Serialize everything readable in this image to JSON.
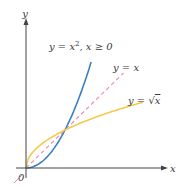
{
  "chart_data": {
    "type": "line",
    "title": "",
    "xlabel": "x",
    "ylabel": "y",
    "origin_label": "0",
    "xlim": [
      0,
      3.6
    ],
    "ylim": [
      0,
      3.8
    ],
    "grid": false,
    "legend": "inline labels",
    "series": [
      {
        "name": "y = x², x ≥ 0",
        "label_parts": {
          "lhs": "y = x",
          "exp": "2",
          "rest": ", x ≥ 0"
        },
        "color": "#3a7fc4",
        "style": "solid",
        "x": [
          0,
          0.25,
          0.5,
          0.75,
          1,
          1.25,
          1.5,
          1.67
        ],
        "y": [
          0,
          0.0625,
          0.25,
          0.5625,
          1,
          1.5625,
          2.25,
          2.79
        ]
      },
      {
        "name": "y = x",
        "label": "y = x",
        "color": "#e58aa6",
        "style": "dashed",
        "x": [
          0,
          2.5
        ],
        "y": [
          0,
          2.5
        ]
      },
      {
        "name": "y = √x",
        "label_parts": {
          "lhs": "y = ",
          "radical": "√",
          "arg": "x"
        },
        "color": "#f5c94a",
        "style": "solid",
        "x": [
          0,
          0.05,
          0.25,
          0.5,
          1,
          1.5,
          2,
          2.5,
          3
        ],
        "y": [
          0,
          0.224,
          0.5,
          0.707,
          1,
          1.225,
          1.414,
          1.581,
          1.732
        ]
      }
    ],
    "annotations": [
      {
        "text": "y = x², x ≥ 0",
        "near": [
          1.2,
          3.3
        ]
      },
      {
        "text": "y = x",
        "near": [
          2.4,
          2.7
        ]
      },
      {
        "text": "y = √x",
        "near": [
          2.5,
          1.9
        ]
      }
    ]
  },
  "axes": {
    "x_label": "x",
    "y_label": "y",
    "origin": "0",
    "axis_color": "#444444"
  }
}
